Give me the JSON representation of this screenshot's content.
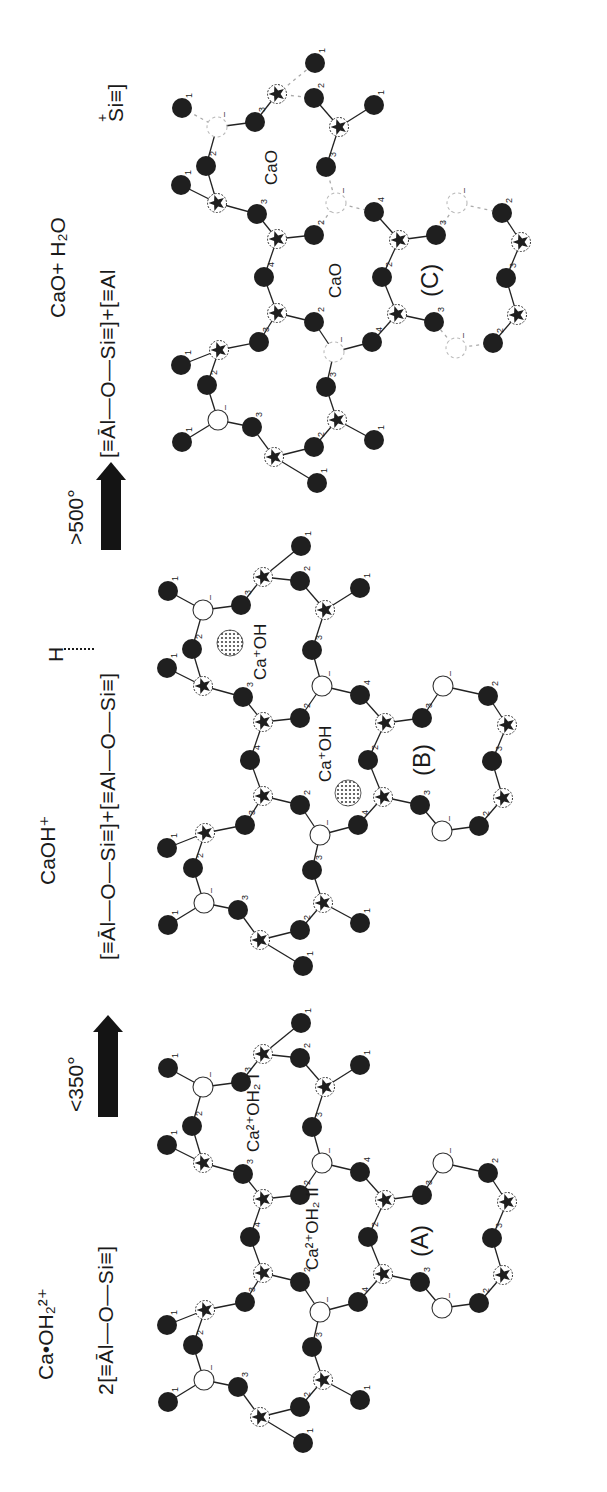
{
  "figure": {
    "reactions": [
      {
        "id": "A",
        "species_label": "Ca•OH₂²⁺",
        "equation": "2[≡Āl—O—Si≡]",
        "temperature": "<350°",
        "panel_label": "(A)"
      },
      {
        "id": "B",
        "species_label": "CaOH⁺",
        "equation": "[≡Āl—O—Si≡]+[≡Al—O—Si≡]",
        "hydrogen_label": "H",
        "panel_label": "(B)",
        "temperature": ">500°"
      },
      {
        "id": "C",
        "species_label": "CaO+ H₂O",
        "equation": "[≡Āl—O—Si≡]+[≡Al",
        "cation_label": "+",
        "equation_tail": "Si≡]",
        "panel_label": "(C)"
      }
    ],
    "inner_labels": {
      "A_1": "Ca²⁺OH₂ I",
      "A_2": "Ca²⁺OH₂ II",
      "B_1": "Ca⁺OH",
      "B_2": "Ca⁺OH",
      "C_1": "CaO",
      "C_2": "CaO"
    },
    "colors": {
      "ink": "#1a1a1a",
      "oxygen": "#1f1f1f",
      "background": "#ffffff",
      "hatch": "#555555"
    },
    "legend_atom_types": [
      "oxygen-filled",
      "silicon-star",
      "aluminum-open",
      "calcium-hatched"
    ],
    "framework": {
      "atoms": [
        [
          168,
          1068,
          "O",
          "1"
        ],
        [
          203,
          1087,
          "Al",
          "–"
        ],
        [
          241,
          1082,
          "O",
          "3"
        ],
        [
          263,
          1054,
          "Si",
          ""
        ],
        [
          301,
          1023,
          "O",
          "1"
        ],
        [
          300,
          1058,
          "O",
          "2"
        ],
        [
          325,
          1087,
          "Si",
          ""
        ],
        [
          360,
          1065,
          "O",
          "1"
        ],
        [
          312,
          1127,
          "O",
          "3"
        ],
        [
          192,
          1126,
          "O",
          "2"
        ],
        [
          167,
          1145,
          "O",
          "1"
        ],
        [
          203,
          1163,
          "Si",
          ""
        ],
        [
          243,
          1174,
          "O",
          "3"
        ],
        [
          263,
          1199,
          "Si",
          ""
        ],
        [
          300,
          1195,
          "O",
          "2"
        ],
        [
          322,
          1163,
          "Al",
          "–"
        ],
        [
          360,
          1172,
          "O",
          "4"
        ],
        [
          250,
          1237,
          "O",
          "4"
        ],
        [
          385,
          1200,
          "Si",
          ""
        ],
        [
          422,
          1195,
          "O",
          "3"
        ],
        [
          443,
          1163,
          "Al",
          "–"
        ],
        [
          488,
          1173,
          "O",
          "2"
        ],
        [
          507,
          1202,
          "Si",
          ""
        ],
        [
          492,
          1238,
          "O",
          "3"
        ],
        [
          503,
          1275,
          "Si",
          ""
        ],
        [
          479,
          1303,
          "O",
          "2"
        ],
        [
          442,
          1308,
          "Al",
          "–"
        ],
        [
          420,
          1282,
          "O",
          "3"
        ],
        [
          383,
          1274,
          "Si",
          ""
        ],
        [
          368,
          1237,
          "O",
          "2"
        ],
        [
          358,
          1302,
          "O",
          "4"
        ],
        [
          263,
          1273,
          "Si",
          ""
        ],
        [
          300,
          1282,
          "O",
          "2"
        ],
        [
          320,
          1312,
          "Al",
          "–"
        ],
        [
          245,
          1302,
          "O",
          "3"
        ],
        [
          205,
          1310,
          "Si",
          ""
        ],
        [
          167,
          1325,
          "O",
          "1"
        ],
        [
          193,
          1345,
          "O",
          "2"
        ],
        [
          204,
          1380,
          "Al",
          "–"
        ],
        [
          168,
          1402,
          "O",
          "1"
        ],
        [
          238,
          1387,
          "O",
          "3"
        ],
        [
          260,
          1417,
          "Si",
          ""
        ],
        [
          300,
          1407,
          "O",
          "2"
        ],
        [
          303,
          1443,
          "O",
          "1"
        ],
        [
          312,
          1347,
          "O",
          "3"
        ],
        [
          323,
          1380,
          "Si",
          ""
        ],
        [
          360,
          1400,
          "O",
          "1"
        ]
      ],
      "bonds": [
        [
          0,
          1
        ],
        [
          1,
          2
        ],
        [
          2,
          3
        ],
        [
          3,
          4
        ],
        [
          3,
          5
        ],
        [
          5,
          6
        ],
        [
          6,
          7
        ],
        [
          6,
          8
        ],
        [
          8,
          15
        ],
        [
          1,
          9
        ],
        [
          9,
          11
        ],
        [
          10,
          11
        ],
        [
          11,
          12
        ],
        [
          12,
          13
        ],
        [
          13,
          14
        ],
        [
          14,
          15
        ],
        [
          15,
          16
        ],
        [
          13,
          17
        ],
        [
          16,
          18
        ],
        [
          18,
          19
        ],
        [
          19,
          20
        ],
        [
          20,
          21
        ],
        [
          21,
          22
        ],
        [
          22,
          23
        ],
        [
          23,
          24
        ],
        [
          24,
          25
        ],
        [
          25,
          26
        ],
        [
          26,
          27
        ],
        [
          27,
          28
        ],
        [
          28,
          29
        ],
        [
          29,
          18
        ],
        [
          28,
          30
        ],
        [
          30,
          33
        ],
        [
          17,
          31
        ],
        [
          31,
          32
        ],
        [
          32,
          33
        ],
        [
          31,
          34
        ],
        [
          34,
          35
        ],
        [
          35,
          36
        ],
        [
          35,
          37
        ],
        [
          37,
          38
        ],
        [
          38,
          39
        ],
        [
          38,
          40
        ],
        [
          40,
          41
        ],
        [
          41,
          42
        ],
        [
          41,
          43
        ],
        [
          33,
          44
        ],
        [
          44,
          45
        ],
        [
          45,
          46
        ],
        [
          45,
          42
        ]
      ]
    },
    "structures": [
      {
        "id": "A",
        "dx": 0,
        "dy": 0,
        "faded": []
      },
      {
        "id": "B",
        "dx": 0,
        "dy": -477,
        "faded": [],
        "ca_spheres": [
          [
            230,
            643
          ],
          [
            348,
            793
          ]
        ]
      },
      {
        "id": "C",
        "dx": 14,
        "dy": -960,
        "faded": [
          1,
          15,
          20,
          26,
          33
        ],
        "broken_bonds": [
          [
            3,
            4
          ],
          [
            3,
            5
          ],
          [
            8,
            15
          ],
          [
            14,
            15
          ],
          [
            15,
            16
          ],
          [
            0,
            1
          ],
          [
            19,
            20
          ],
          [
            20,
            21
          ],
          [
            25,
            26
          ],
          [
            26,
            27
          ]
        ]
      }
    ]
  }
}
